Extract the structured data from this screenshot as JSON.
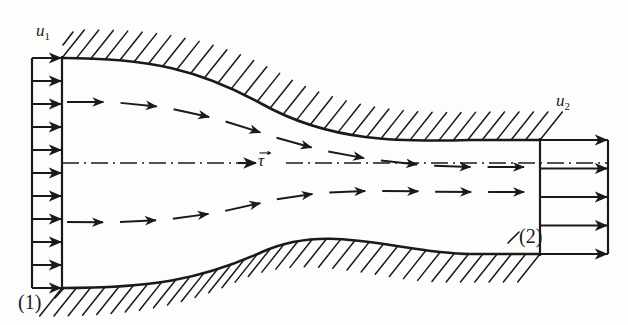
{
  "figure": {
    "background_color": "#fdfdfc",
    "ink_color": "#1a1a1a"
  },
  "labels": {
    "inlet_velocity": "u",
    "inlet_velocity_sub": "1",
    "outlet_velocity": "u",
    "outlet_velocity_sub": "2",
    "section_one": "(1)",
    "section_two": "(2)",
    "axis_vector": "τ"
  },
  "geometry": {
    "inlet_profile": {
      "box_left_x": 32,
      "box_right_x": 62,
      "top_y": 58,
      "bottom_y": 288,
      "arrow_count": 11,
      "arrow_length": 30,
      "uniform": true
    },
    "outlet_profile": {
      "box_left_x": 540,
      "box_right_x": 608,
      "top_y": 140,
      "bottom_y": 254,
      "arrow_count": 5,
      "arrow_length": 68,
      "uniform": true
    },
    "top_wall": {
      "start": [
        62,
        58
      ],
      "end": [
        540,
        140
      ],
      "type": "s-curve",
      "hatch_side": "above",
      "hatch_angle_deg": -55,
      "hatch_count": 34,
      "hatch_length": 36
    },
    "bottom_wall": {
      "start": [
        62,
        288
      ],
      "end": [
        540,
        254
      ],
      "type": "s-curve",
      "hatch_side": "below",
      "hatch_angle_deg": 55,
      "hatch_count": 34,
      "hatch_length": 36
    },
    "centerline": {
      "y": 163,
      "start_x": 62,
      "end_x": 608,
      "style": "dash-dot",
      "arrow_at_x": 250
    },
    "streamlines": [
      {
        "name": "upper-streamline",
        "start": [
          66,
          102
        ],
        "end": [
          540,
          167
        ],
        "style": "dashed-with-arrowheads",
        "segment_count": 9
      },
      {
        "name": "lower-streamline",
        "start": [
          66,
          222
        ],
        "end": [
          540,
          192
        ],
        "style": "dashed-with-arrowheads",
        "segment_count": 9
      }
    ]
  },
  "chart_data": {
    "type": "diagram",
    "annotations": [
      "u1",
      "u2",
      "(1)",
      "(2)",
      "τ vector"
    ],
    "inlet_profile_values": [
      1,
      1,
      1,
      1,
      1,
      1,
      1,
      1,
      1,
      1,
      1
    ],
    "outlet_profile_values": [
      2.27,
      2.27,
      2.27,
      2.27,
      2.27
    ],
    "xlabel": "",
    "ylabel": ""
  }
}
